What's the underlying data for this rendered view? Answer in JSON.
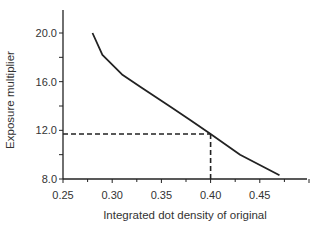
{
  "chart_data": {
    "type": "line",
    "title": "",
    "xlabel": "Integrated dot density of original",
    "ylabel": "Exposure multiplier",
    "xlim": [
      0.25,
      0.5
    ],
    "ylim": [
      8.0,
      22.0
    ],
    "x_ticks": [
      "0.25",
      "0.30",
      "0.35",
      "0.40",
      "0.45"
    ],
    "y_ticks": [
      "8.0",
      "12.0",
      "16.0",
      "20.0"
    ],
    "grid": false,
    "legend": null,
    "series": [
      {
        "name": "Exposure multiplier curve",
        "x": [
          0.28,
          0.29,
          0.31,
          0.33,
          0.36,
          0.38,
          0.4,
          0.43,
          0.47
        ],
        "y": [
          20.0,
          18.2,
          16.6,
          15.5,
          13.9,
          12.8,
          11.7,
          10.0,
          8.3
        ]
      }
    ],
    "annotations": [
      {
        "type": "dashed-guide",
        "x": 0.4,
        "y": 11.7,
        "description": "dashed lines from x=0.40 up to curve and across to y-axis at ~11.7"
      }
    ]
  }
}
